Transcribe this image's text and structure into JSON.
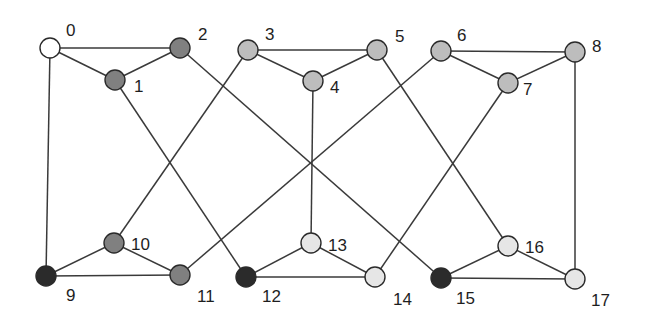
{
  "diagram": {
    "type": "graph",
    "colors": {
      "white": "#ffffff",
      "dark_gray": "#808080",
      "mid_gray": "#bdbdbd",
      "light_gray": "#e6e6e6",
      "black": "#2b2b2b"
    },
    "nodes": [
      {
        "id": 0,
        "label": "0",
        "x": 50,
        "y": 48,
        "color": "#ffffff",
        "lx": 66,
        "ly": 36
      },
      {
        "id": 1,
        "label": "1",
        "x": 115,
        "y": 80,
        "color": "#808080",
        "lx": 134,
        "ly": 92
      },
      {
        "id": 2,
        "label": "2",
        "x": 180,
        "y": 48,
        "color": "#808080",
        "lx": 198,
        "ly": 40
      },
      {
        "id": 3,
        "label": "3",
        "x": 248,
        "y": 50,
        "color": "#bdbdbd",
        "lx": 265,
        "ly": 40
      },
      {
        "id": 4,
        "label": "4",
        "x": 313,
        "y": 81,
        "color": "#bdbdbd",
        "lx": 330,
        "ly": 93
      },
      {
        "id": 5,
        "label": "5",
        "x": 377,
        "y": 50,
        "color": "#bdbdbd",
        "lx": 395,
        "ly": 42
      },
      {
        "id": 6,
        "label": "6",
        "x": 441,
        "y": 51,
        "color": "#bdbdbd",
        "lx": 457,
        "ly": 41
      },
      {
        "id": 7,
        "label": "7",
        "x": 508,
        "y": 83,
        "color": "#bdbdbd",
        "lx": 523,
        "ly": 95
      },
      {
        "id": 8,
        "label": "8",
        "x": 575,
        "y": 52,
        "color": "#bdbdbd",
        "lx": 592,
        "ly": 52
      },
      {
        "id": 9,
        "label": "9",
        "x": 46,
        "y": 276,
        "color": "#2b2b2b",
        "lx": 66,
        "ly": 301
      },
      {
        "id": 10,
        "label": "10",
        "x": 114,
        "y": 243,
        "color": "#808080",
        "lx": 131,
        "ly": 250
      },
      {
        "id": 11,
        "label": "11",
        "x": 180,
        "y": 275,
        "color": "#808080",
        "lx": 197,
        "ly": 302
      },
      {
        "id": 12,
        "label": "12",
        "x": 246,
        "y": 277,
        "color": "#2b2b2b",
        "lx": 262,
        "ly": 302
      },
      {
        "id": 13,
        "label": "13",
        "x": 311,
        "y": 243,
        "color": "#e6e6e6",
        "lx": 328,
        "ly": 251
      },
      {
        "id": 14,
        "label": "14",
        "x": 375,
        "y": 277,
        "color": "#e6e6e6",
        "lx": 393,
        "ly": 305
      },
      {
        "id": 15,
        "label": "15",
        "x": 441,
        "y": 278,
        "color": "#2b2b2b",
        "lx": 456,
        "ly": 304
      },
      {
        "id": 16,
        "label": "16",
        "x": 508,
        "y": 246,
        "color": "#e6e6e6",
        "lx": 525,
        "ly": 253
      },
      {
        "id": 17,
        "label": "17",
        "x": 575,
        "y": 279,
        "color": "#e6e6e6",
        "lx": 591,
        "ly": 306
      }
    ],
    "edges": [
      [
        0,
        1
      ],
      [
        0,
        2
      ],
      [
        1,
        2
      ],
      [
        0,
        9
      ],
      [
        3,
        4
      ],
      [
        3,
        5
      ],
      [
        4,
        5
      ],
      [
        6,
        7
      ],
      [
        6,
        8
      ],
      [
        7,
        8
      ],
      [
        9,
        10
      ],
      [
        9,
        11
      ],
      [
        10,
        11
      ],
      [
        12,
        13
      ],
      [
        12,
        14
      ],
      [
        13,
        14
      ],
      [
        15,
        16
      ],
      [
        15,
        17
      ],
      [
        16,
        17
      ],
      [
        1,
        12
      ],
      [
        2,
        15
      ],
      [
        3,
        10
      ],
      [
        4,
        13
      ],
      [
        5,
        16
      ],
      [
        6,
        11
      ],
      [
        7,
        14
      ],
      [
        8,
        17
      ]
    ],
    "node_radius": 10
  }
}
